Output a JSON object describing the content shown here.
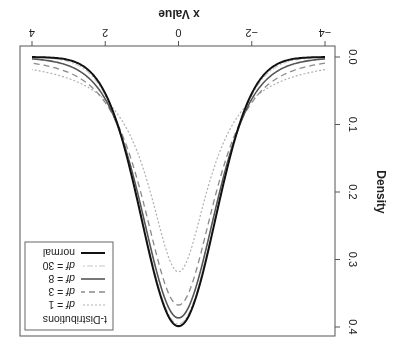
{
  "chart_data": {
    "type": "line",
    "title": "",
    "xlabel": "x Value",
    "ylabel": "Density",
    "xlim": [
      -4,
      4
    ],
    "ylim": [
      0.0,
      0.4
    ],
    "grid": false,
    "rotation_deg": 180,
    "x_ticks": [
      "-4",
      "-2",
      "0",
      "2",
      "4"
    ],
    "y_ticks": [
      "0.0",
      "0.1",
      "0.2",
      "0.3",
      "0.4"
    ],
    "legend": {
      "title": "t-Distributions",
      "position": "top-left",
      "entries": [
        {
          "label_prefix": "df",
          "label_suffix": " = 1",
          "style": "dotted",
          "color": "#b0b0b0",
          "width": 1.2
        },
        {
          "label_prefix": "df",
          "label_suffix": " = 3",
          "style": "dashed",
          "color": "#8a8a8a",
          "width": 1.3
        },
        {
          "label_prefix": "df",
          "label_suffix": " = 8",
          "style": "solid",
          "color": "#555555",
          "width": 1.6
        },
        {
          "label_prefix": "df",
          "label_suffix": " = 30",
          "style": "dotdash",
          "color": "#c8c8c8",
          "width": 1.2
        },
        {
          "label_prefix": "",
          "label_suffix": "normal",
          "style": "solid",
          "color": "#111111",
          "width": 2.0
        }
      ]
    },
    "series": [
      {
        "name": "df = 1",
        "df": 1,
        "peak": 0.318
      },
      {
        "name": "df = 3",
        "df": 3,
        "peak": 0.368
      },
      {
        "name": "df = 8",
        "df": 8,
        "peak": 0.387
      },
      {
        "name": "df = 30",
        "df": 30,
        "peak": 0.396
      },
      {
        "name": "normal",
        "df": null,
        "peak": 0.399
      }
    ]
  }
}
